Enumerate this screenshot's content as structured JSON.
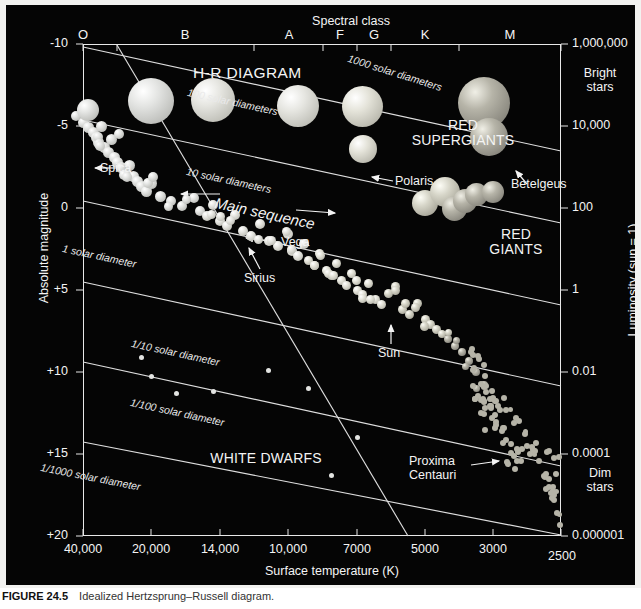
{
  "figure": {
    "title": "H-R DIAGRAM",
    "caption_number": "FIGURE 24.5",
    "caption_text": "Idealized Hertzsprung–Russell diagram."
  },
  "axes": {
    "x_title": "Surface temperature (K)",
    "x_ticks": [
      "40,000",
      "20,000",
      "14,000",
      "10,000",
      "7000",
      "5000",
      "3000",
      "2500"
    ],
    "y_title": "Absolute magnitude",
    "y_ticks": [
      "-10",
      "-5",
      "0",
      "+5",
      "+10",
      "+15",
      "+20"
    ],
    "y2_title": "Luminosity (sun = 1)",
    "y2_ticks": [
      "1,000,000",
      "10,000",
      "100",
      "1",
      "0.01",
      "0.0001",
      "0.000001"
    ],
    "spectral_title": "Spectral class",
    "spectral_classes": [
      "O",
      "B",
      "A",
      "F",
      "G",
      "K",
      "M"
    ]
  },
  "annotations": {
    "bright_stars": "Bright\nstars",
    "bright_stars_line1": "Bright",
    "bright_stars_line2": "stars",
    "dim_stars_line1": "Dim",
    "dim_stars_line2": "stars",
    "red_supergiants_line1": "RED",
    "red_supergiants_line2": "SUPERGIANTS",
    "red_giants_line1": "RED",
    "red_giants_line2": "GIANTS",
    "white_dwarfs": "WHITE DWARFS",
    "main_sequence": "Main sequence"
  },
  "diagonal_labels": [
    "1000 solar diameters",
    "100 solar diameters",
    "10 solar diameters",
    "1 solar diameter",
    "1/10 solar diameter",
    "1/100 solar diameter",
    "1/1000 solar diameter"
  ],
  "star_labels": [
    {
      "name": "Spica"
    },
    {
      "name": "Polaris"
    },
    {
      "name": "Betelgeus"
    },
    {
      "name": "Vega"
    },
    {
      "name": "Sirius"
    },
    {
      "name": "Sun"
    },
    {
      "name": "Proxima"
    },
    {
      "name": "Centauri"
    }
  ],
  "colors": {
    "background": "#050505",
    "ink": "#f4f4f4",
    "line": "#e8e8e8",
    "hot_star": "#e9e9e0",
    "cool_star": "#9a9a92"
  },
  "chart_data": {
    "type": "scatter",
    "title": "H-R DIAGRAM",
    "xlabel": "Surface temperature (K)",
    "ylabel": "Absolute magnitude",
    "y2label": "Luminosity (sun = 1)",
    "xlim": [
      40000,
      2500
    ],
    "ylim": [
      -10,
      20
    ],
    "x_scale": "reversed-log-like",
    "grid": false,
    "legend": "none",
    "xticks": [
      40000,
      20000,
      14000,
      10000,
      7000,
      5000,
      3000,
      2500
    ],
    "yticks": [
      -10,
      -5,
      0,
      5,
      10,
      15,
      20
    ],
    "y2ticks": [
      1000000,
      10000,
      100,
      1,
      0.01,
      0.0001,
      1e-06
    ],
    "spectral_ticks": [
      "O",
      "B",
      "A",
      "F",
      "G",
      "K",
      "M"
    ],
    "series": [
      {
        "name": "Main sequence",
        "note": "dense diagonal band from upper-left (hot, luminous) to lower-right (cool, dim)",
        "points": [
          [
            40000,
            -5.2
          ],
          [
            38000,
            -4.9
          ],
          [
            36000,
            -4.6
          ],
          [
            35000,
            -4.3
          ],
          [
            34000,
            -4.0
          ],
          [
            33000,
            -5.0
          ],
          [
            32000,
            -3.7
          ],
          [
            31000,
            -3.4
          ],
          [
            30000,
            -4.2
          ],
          [
            29000,
            -3.1
          ],
          [
            28000,
            -2.8
          ],
          [
            27000,
            -2.5
          ],
          [
            26000,
            -2.2
          ],
          [
            25000,
            -2.6
          ],
          [
            24000,
            -1.9
          ],
          [
            23000,
            -1.6
          ],
          [
            22000,
            -1.3
          ],
          [
            21000,
            -1.0
          ],
          [
            20000,
            -1.5
          ],
          [
            19000,
            -0.7
          ],
          [
            18000,
            -0.4
          ],
          [
            17000,
            -0.1
          ],
          [
            16000,
            -0.6
          ],
          [
            15500,
            0.2
          ],
          [
            15000,
            0.5
          ],
          [
            14500,
            -0.2
          ],
          [
            14000,
            0.8
          ],
          [
            13500,
            1.1
          ],
          [
            13000,
            0.4
          ],
          [
            12500,
            1.4
          ],
          [
            12000,
            1.7
          ],
          [
            11500,
            1.0
          ],
          [
            11000,
            2.0
          ],
          [
            10500,
            2.3
          ],
          [
            10000,
            1.6
          ],
          [
            9800,
            2.6
          ],
          [
            9500,
            2.9
          ],
          [
            9200,
            2.2
          ],
          [
            9000,
            3.2
          ],
          [
            8700,
            3.5
          ],
          [
            8500,
            2.8
          ],
          [
            8200,
            3.8
          ],
          [
            8000,
            4.1
          ],
          [
            7800,
            3.4
          ],
          [
            7600,
            4.4
          ],
          [
            7400,
            4.7
          ],
          [
            7200,
            4.0
          ],
          [
            7000,
            5.0
          ],
          [
            6800,
            5.3
          ],
          [
            6600,
            4.6
          ],
          [
            6400,
            5.6
          ],
          [
            6200,
            5.9
          ],
          [
            6000,
            5.2
          ],
          [
            5800,
            4.8
          ],
          [
            5600,
            6.2
          ],
          [
            5400,
            6.5
          ],
          [
            5200,
            5.8
          ],
          [
            5000,
            6.8
          ],
          [
            4800,
            7.1
          ],
          [
            4600,
            7.4
          ],
          [
            4400,
            7.7
          ],
          [
            4200,
            8.0
          ],
          [
            4000,
            8.4
          ],
          [
            3800,
            8.8
          ],
          [
            3600,
            9.3
          ],
          [
            3400,
            10.0
          ],
          [
            3200,
            10.8
          ],
          [
            3000,
            11.6
          ],
          [
            2900,
            12.3
          ],
          [
            2800,
            13.0
          ],
          [
            2750,
            13.8
          ],
          [
            2700,
            14.6
          ],
          [
            2650,
            15.4
          ],
          [
            2600,
            16.2
          ],
          [
            2580,
            17.0
          ],
          [
            2550,
            17.8
          ],
          [
            2530,
            18.6
          ],
          [
            2510,
            19.3
          ]
        ]
      },
      {
        "name": "Red supergiants",
        "note": "large spheres across the top near magnitude -5 to -8",
        "points": [
          [
            20000,
            -6.5
          ],
          [
            14500,
            -6.6
          ],
          [
            9500,
            -6.2
          ],
          [
            6800,
            -6.2
          ],
          [
            3200,
            -6.4
          ],
          [
            3100,
            -4.3
          ]
        ]
      },
      {
        "name": "Red giants",
        "note": "cluster of medium spheres near magnitude 0 on the cool side",
        "points": [
          [
            5000,
            -0.3
          ],
          [
            4300,
            -1.0
          ],
          [
            4000,
            0.0
          ],
          [
            3700,
            -0.4
          ],
          [
            3400,
            -0.8
          ],
          [
            3000,
            -1.0
          ]
        ]
      },
      {
        "name": "White dwarfs",
        "note": "small faint points near magnitude +10 to +16",
        "points": [
          [
            22000,
            9.1
          ],
          [
            20000,
            10.3
          ],
          [
            17500,
            11.3
          ],
          [
            14500,
            11.2
          ],
          [
            11000,
            9.9
          ],
          [
            9000,
            11.0
          ],
          [
            8000,
            16.3
          ],
          [
            7000,
            14.0
          ]
        ]
      }
    ],
    "named_stars": [
      {
        "label": "Spica",
        "temp": 22000,
        "abs_mag": -3.6
      },
      {
        "label": "Polaris",
        "temp": 6800,
        "abs_mag": -3.6
      },
      {
        "label": "Betelgeus",
        "temp": 3200,
        "abs_mag": -5.5
      },
      {
        "label": "Vega",
        "temp": 9600,
        "abs_mag": 0.6
      },
      {
        "label": "Sirius",
        "temp": 9900,
        "abs_mag": 1.4
      },
      {
        "label": "Sun",
        "temp": 5800,
        "abs_mag": 4.8
      },
      {
        "label": "Proxima Centauri",
        "temp": 2900,
        "abs_mag": 15.5
      }
    ],
    "radius_lines": [
      {
        "label": "1000 solar diameters"
      },
      {
        "label": "100 solar diameters"
      },
      {
        "label": "10 solar diameters"
      },
      {
        "label": "1 solar diameter"
      },
      {
        "label": "1/10 solar diameter"
      },
      {
        "label": "1/100 solar diameter"
      },
      {
        "label": "1/1000 solar diameter"
      }
    ]
  }
}
